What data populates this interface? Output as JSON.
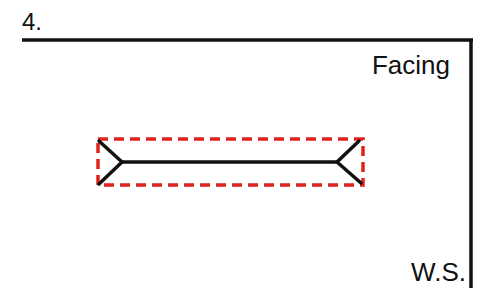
{
  "figure": {
    "number": "4.",
    "labels": {
      "top_right": "Facing",
      "bottom_right": "W.S."
    },
    "colors": {
      "line": "#111111",
      "dashed_box": "#e0241b",
      "background": "#ffffff"
    },
    "shapes": {
      "wall_corner": {
        "top_line": [
          22,
          40,
          472,
          40
        ],
        "side_line": [
          471,
          40,
          471,
          288
        ]
      },
      "dashed_box": {
        "x": 98,
        "y": 139,
        "width": 265,
        "height": 46
      },
      "bar": {
        "x1": 122,
        "y1": 162,
        "x2": 337,
        "y2": 162
      },
      "left_fork": {
        "tip_top": [
          99,
          141
        ],
        "tip_bottom": [
          99,
          184
        ],
        "vertex": [
          122,
          162
        ]
      },
      "right_fork": {
        "tip_top": [
          359,
          141
        ],
        "tip_bottom": [
          361,
          183
        ],
        "vertex": [
          337,
          162
        ]
      }
    }
  }
}
